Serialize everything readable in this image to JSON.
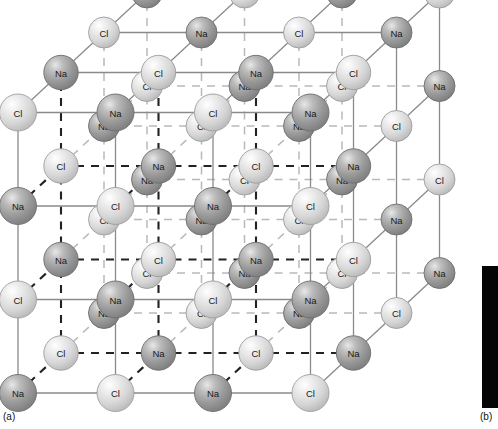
{
  "figure": {
    "caption_a": "(a)",
    "caption_b": "(b)",
    "panel_b_color": "#050505"
  },
  "legend": {
    "sodium_label": "Na",
    "chlorine_label": "Cl",
    "sodium_color": "#9a9a9a",
    "chlorine_color": "#dcdcdc",
    "bond_color": "#8a8a8a",
    "hidden_bond_color": "#222222"
  },
  "lattice": {
    "type": "rock-salt",
    "cells_per_edge": 3,
    "atoms_per_edge": 4,
    "projection": "oblique",
    "origin": {
      "x": 18,
      "y": 393
    },
    "step_x": 97.5,
    "step_y": -93.5,
    "depth_dx": 43.0,
    "depth_dy": -40.0,
    "radius_front": 18.5,
    "radius_back": 15.5,
    "labels_by_parity": {
      "even": "Na",
      "odd": "Cl"
    },
    "visible_faces": [
      "front",
      "top",
      "right",
      "left-cut",
      "interior-dashed"
    ],
    "atom_counts": {
      "Na": 32,
      "Cl": 32,
      "total": 64
    },
    "front_face_rows": [
      [
        "Cl",
        "Na",
        "Cl",
        "Na"
      ],
      [
        "Na",
        "Cl",
        "Na",
        "Cl"
      ],
      [
        "Cl",
        "Na",
        "Cl",
        "Na"
      ],
      [
        "Na",
        "Cl",
        "Na",
        "Cl"
      ]
    ],
    "top_face_rows": [
      [
        "Cl",
        "Na",
        "Cl",
        "Na"
      ],
      [
        "Na",
        "Cl",
        "Na",
        "Cl"
      ],
      [
        "Cl",
        "Na",
        "Cl",
        "Na"
      ],
      [
        "Na",
        "Cl",
        "Na",
        "Cl"
      ]
    ]
  }
}
